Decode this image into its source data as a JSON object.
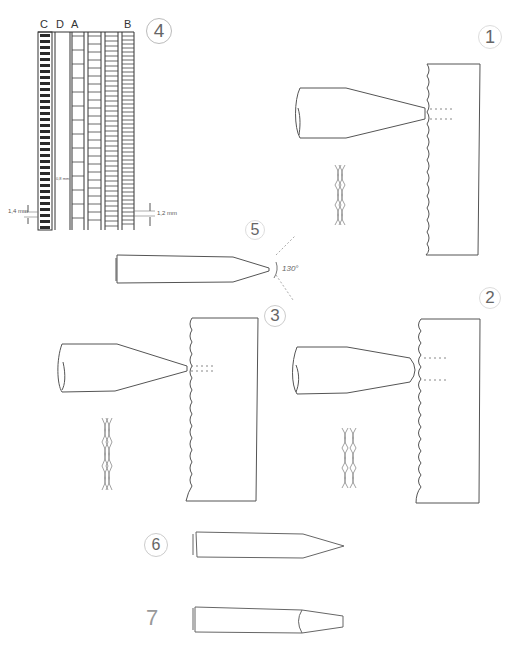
{
  "figures": {
    "fig4": {
      "number": "4",
      "column_labels": [
        "C",
        "D",
        "A",
        "B"
      ],
      "dimension_left": "1,4 mm",
      "dimension_right": "1,2 mm",
      "dimension_middle": "0,8 mm"
    },
    "fig1": {
      "number": "1"
    },
    "fig2": {
      "number": "2"
    },
    "fig3": {
      "number": "3"
    },
    "fig5": {
      "number": "5",
      "angle_label": "130°"
    },
    "fig6": {
      "number": "6"
    },
    "fig7": {
      "number": "7"
    }
  },
  "colors": {
    "line": "#444444",
    "light_line": "#999999",
    "dark_fill": "#222222"
  }
}
